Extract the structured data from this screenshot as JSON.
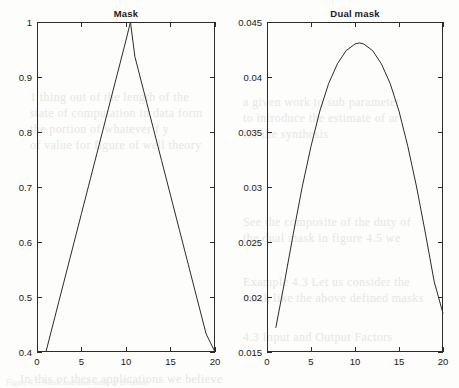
{
  "figure": {
    "caption": "Figure 4.5: Mask and dual mask of 20 bands"
  },
  "background_text": [
    "1 thing out of the length of the",
    "state of computation in data  form",
    "the portion of  whatever  f y",
    "of value for figure of well theory",
    "a given work  to  sub  parameter",
    "to introduce the estimate of  ar",
    "for the synthesis",
    "See the composite of  the  duty  of",
    "the dual mask  in  figure  4.5  we",
    "Example 4.3    Let us consider the",
    "mask  like the above  defined  masks",
    "4.3  Input and  Output Factors",
    "In this or these applications we believe"
  ],
  "chart_data": [
    {
      "type": "line",
      "title": "Mask",
      "xlabel": "",
      "ylabel": "",
      "xlim": [
        0,
        20
      ],
      "ylim": [
        0.4,
        1.0
      ],
      "xticks": [
        0,
        5,
        10,
        15,
        20
      ],
      "xtick_labels": [
        "0",
        "5",
        "10",
        "15",
        "20"
      ],
      "yticks": [
        0.4,
        0.5,
        0.6,
        0.7,
        0.8,
        0.9,
        1.0
      ],
      "ytick_labels": [
        "0.4",
        "0.5",
        "0.6",
        "0.7",
        "0.8",
        "0.9",
        "1"
      ],
      "grid": false,
      "legend": false,
      "series": [
        {
          "name": "mask",
          "x": [
            1,
            2,
            3,
            4,
            5,
            6,
            7,
            8,
            9,
            10,
            10.5,
            11,
            12,
            13,
            14,
            15,
            16,
            17,
            18,
            19,
            20
          ],
          "y": [
            0.4,
            0.463,
            0.526,
            0.589,
            0.652,
            0.715,
            0.778,
            0.841,
            0.904,
            0.967,
            1.0,
            0.937,
            0.874,
            0.811,
            0.748,
            0.685,
            0.622,
            0.559,
            0.496,
            0.433,
            0.4
          ]
        }
      ]
    },
    {
      "type": "line",
      "title": "Dual mask",
      "xlabel": "",
      "ylabel": "",
      "xlim": [
        0,
        20
      ],
      "ylim": [
        0.015,
        0.045
      ],
      "xticks": [
        0,
        5,
        10,
        15,
        20
      ],
      "xtick_labels": [
        "0",
        "5",
        "10",
        "15",
        "20"
      ],
      "yticks": [
        0.015,
        0.02,
        0.025,
        0.03,
        0.035,
        0.04,
        0.045
      ],
      "ytick_labels": [
        "0.015",
        "0.02",
        "0.025",
        "0.03",
        "0.035",
        "0.04",
        "0.045"
      ],
      "grid": false,
      "legend": false,
      "series": [
        {
          "name": "dual mask",
          "x": [
            1,
            2,
            3,
            4,
            5,
            6,
            7,
            8,
            9,
            10,
            10.5,
            11,
            12,
            13,
            14,
            15,
            16,
            17,
            18,
            19,
            20
          ],
          "y": [
            0.0172,
            0.0214,
            0.0258,
            0.03,
            0.0337,
            0.0369,
            0.0394,
            0.0412,
            0.0424,
            0.043,
            0.0431,
            0.043,
            0.0424,
            0.0412,
            0.0394,
            0.0369,
            0.0337,
            0.03,
            0.0258,
            0.0214,
            0.0185
          ]
        }
      ]
    }
  ],
  "colors": {
    "line": "#2b2b2b",
    "axis": "#2b2b2b",
    "background": "#fdfdfc",
    "text": "#181818"
  }
}
